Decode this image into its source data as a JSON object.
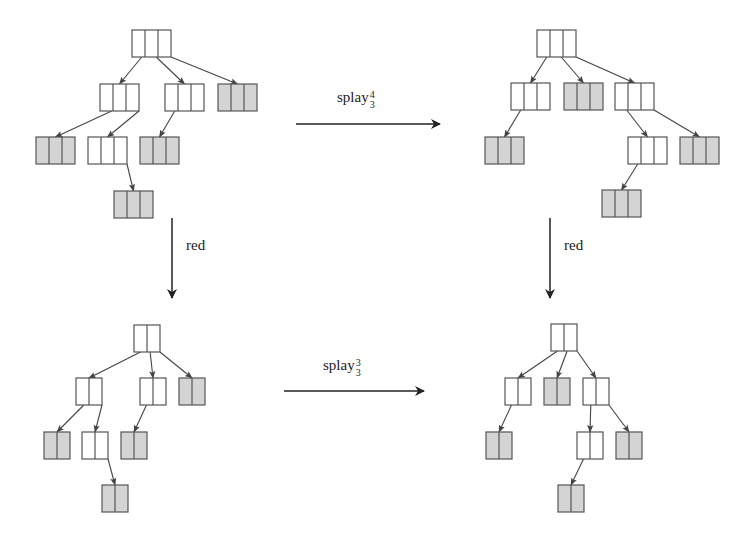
{
  "diagram": {
    "type": "tree-transformation-diagram",
    "colors": {
      "stroke": "#555555",
      "shaded_fill": "#d4d4d4",
      "white_fill": "#ffffff",
      "arrow": "#222222"
    },
    "trees": [
      {
        "id": "top-left",
        "cells_per_node": 3,
        "nodes": [
          {
            "id": "r",
            "x": 132,
            "y": 30,
            "shaded": false
          },
          {
            "id": "a",
            "x": 100,
            "y": 84,
            "shaded": false,
            "parent": "r"
          },
          {
            "id": "b",
            "x": 165,
            "y": 84,
            "shaded": false,
            "parent": "r"
          },
          {
            "id": "c",
            "x": 218,
            "y": 84,
            "shaded": true,
            "parent": "r"
          },
          {
            "id": "d",
            "x": 36,
            "y": 137,
            "shaded": true,
            "parent": "a"
          },
          {
            "id": "e",
            "x": 88,
            "y": 137,
            "shaded": false,
            "parent": "a"
          },
          {
            "id": "f",
            "x": 140,
            "y": 137,
            "shaded": true,
            "parent": "b"
          },
          {
            "id": "g",
            "x": 114,
            "y": 191,
            "shaded": true,
            "parent": "e"
          }
        ]
      },
      {
        "id": "top-right",
        "cells_per_node": 3,
        "nodes": [
          {
            "id": "r",
            "x": 537,
            "y": 30,
            "shaded": false
          },
          {
            "id": "a",
            "x": 511,
            "y": 83,
            "shaded": false,
            "parent": "r"
          },
          {
            "id": "b",
            "x": 564,
            "y": 83,
            "shaded": true,
            "parent": "r"
          },
          {
            "id": "c",
            "x": 615,
            "y": 83,
            "shaded": false,
            "parent": "r"
          },
          {
            "id": "d",
            "x": 485,
            "y": 137,
            "shaded": true,
            "parent": "a"
          },
          {
            "id": "e",
            "x": 628,
            "y": 137,
            "shaded": false,
            "parent": "c"
          },
          {
            "id": "f",
            "x": 680,
            "y": 137,
            "shaded": true,
            "parent": "c"
          },
          {
            "id": "g",
            "x": 602,
            "y": 190,
            "shaded": true,
            "parent": "e"
          }
        ]
      },
      {
        "id": "bottom-left",
        "cells_per_node": 2,
        "nodes": [
          {
            "id": "r",
            "x": 134,
            "y": 325,
            "shaded": false
          },
          {
            "id": "a",
            "x": 76,
            "y": 378,
            "shaded": false,
            "parent": "r"
          },
          {
            "id": "b",
            "x": 140,
            "y": 378,
            "shaded": false,
            "parent": "r"
          },
          {
            "id": "c",
            "x": 179,
            "y": 378,
            "shaded": true,
            "parent": "r"
          },
          {
            "id": "d",
            "x": 44,
            "y": 432,
            "shaded": true,
            "parent": "a"
          },
          {
            "id": "e",
            "x": 82,
            "y": 432,
            "shaded": false,
            "parent": "a"
          },
          {
            "id": "f",
            "x": 121,
            "y": 432,
            "shaded": true,
            "parent": "b"
          },
          {
            "id": "g",
            "x": 102,
            "y": 485,
            "shaded": true,
            "parent": "e"
          }
        ]
      },
      {
        "id": "bottom-right",
        "cells_per_node": 2,
        "nodes": [
          {
            "id": "r",
            "x": 551,
            "y": 324,
            "shaded": false
          },
          {
            "id": "a",
            "x": 505,
            "y": 378,
            "shaded": false,
            "parent": "r"
          },
          {
            "id": "b",
            "x": 544,
            "y": 378,
            "shaded": true,
            "parent": "r"
          },
          {
            "id": "c",
            "x": 583,
            "y": 378,
            "shaded": false,
            "parent": "r"
          },
          {
            "id": "d",
            "x": 486,
            "y": 432,
            "shaded": true,
            "parent": "a"
          },
          {
            "id": "e",
            "x": 577,
            "y": 432,
            "shaded": false,
            "parent": "c"
          },
          {
            "id": "f",
            "x": 616,
            "y": 432,
            "shaded": true,
            "parent": "c"
          },
          {
            "id": "g",
            "x": 558,
            "y": 485,
            "shaded": true,
            "parent": "e"
          }
        ]
      }
    ],
    "arrows": [
      {
        "id": "top-horizontal",
        "label_base": "splay",
        "label_sub": "3",
        "label_sup": "4",
        "x1": 296,
        "y1": 124,
        "x2": 440,
        "y2": 124
      },
      {
        "id": "bottom-horizontal",
        "label_base": "splay",
        "label_sub": "3",
        "label_sup": "3",
        "x1": 284,
        "y1": 391,
        "x2": 424,
        "y2": 391
      },
      {
        "id": "left-vertical",
        "label": "red",
        "x1": 172,
        "y1": 218,
        "x2": 172,
        "y2": 298
      },
      {
        "id": "right-vertical",
        "label": "red",
        "x1": 550,
        "y1": 218,
        "x2": 550,
        "y2": 298
      }
    ]
  },
  "labels": {
    "top_splay": {
      "base": "splay",
      "sup": "4",
      "sub": "3"
    },
    "bottom_splay": {
      "base": "splay",
      "sup": "3",
      "sub": "3"
    },
    "left_red": "red",
    "right_red": "red"
  }
}
